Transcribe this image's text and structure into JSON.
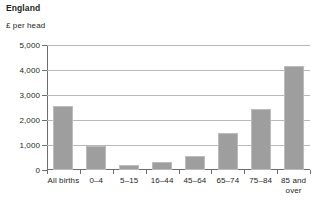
{
  "chart_data": {
    "type": "bar",
    "title": "England",
    "subtitle": "£ per head",
    "xlabel": "",
    "ylabel": "£ per head",
    "ylim": [
      0,
      5000
    ],
    "grid": true,
    "legend": "none",
    "bar_color": "#9e9e9e",
    "categories": [
      "All births",
      "0–4",
      "5–15",
      "16–44",
      "45–64",
      "65–74",
      "75–84",
      "85 and over"
    ],
    "category_lines": [
      [
        "All births"
      ],
      [
        "0–4"
      ],
      [
        "5–15"
      ],
      [
        "16–44"
      ],
      [
        "45–64"
      ],
      [
        "65–74"
      ],
      [
        "75–84"
      ],
      [
        "85 and",
        "over"
      ]
    ],
    "values": [
      2560,
      960,
      210,
      330,
      560,
      1470,
      2450,
      4180
    ],
    "yticks": [
      5000,
      4000,
      3000,
      2000,
      1000,
      0
    ],
    "ytick_labels": [
      "5,000",
      "4,000",
      "3,000",
      "2,000",
      "1,000",
      "0"
    ]
  }
}
